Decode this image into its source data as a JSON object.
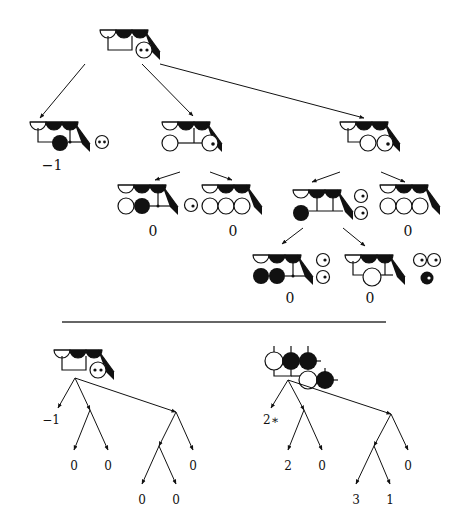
{
  "figure": {
    "type": "game-tree-diagram",
    "colors": {
      "ink": "#111111",
      "background": "#ffffff",
      "rule": "#333333"
    },
    "top_tree": {
      "root": {
        "id": "root",
        "x": 128,
        "y": 44,
        "label": ""
      },
      "nodes": [
        {
          "id": "L",
          "x": 55,
          "y": 138,
          "value": "−1",
          "value_x": 52,
          "value_y": 158
        },
        {
          "id": "M",
          "x": 195,
          "y": 138,
          "value": ""
        },
        {
          "id": "R",
          "x": 370,
          "y": 138,
          "value": ""
        },
        {
          "id": "ML",
          "x": 150,
          "y": 200,
          "value": "0",
          "value_x": 153,
          "value_y": 224
        },
        {
          "id": "MR",
          "x": 230,
          "y": 200,
          "value": "0",
          "value_x": 233,
          "value_y": 224
        },
        {
          "id": "RL",
          "x": 315,
          "y": 200,
          "value": "",
          "value_x": 0,
          "value_y": 0
        },
        {
          "id": "RR",
          "x": 405,
          "y": 200,
          "value": "0",
          "value_x": 408,
          "value_y": 224
        },
        {
          "id": "RLL",
          "x": 285,
          "y": 265,
          "value": "0",
          "value_x": 290,
          "value_y": 291
        },
        {
          "id": "RLR",
          "x": 370,
          "y": 265,
          "value": "0",
          "value_x": 370,
          "value_y": 291
        }
      ],
      "edges": [
        {
          "from": [
            85,
            64
          ],
          "to": [
            40,
            118
          ]
        },
        {
          "from": [
            142,
            64
          ],
          "to": [
            193,
            116
          ]
        },
        {
          "from": [
            160,
            64
          ],
          "to": [
            364,
            118
          ]
        },
        {
          "from": [
            180,
            172
          ],
          "to": [
            155,
            180
          ]
        },
        {
          "from": [
            210,
            172
          ],
          "to": [
            232,
            180
          ]
        },
        {
          "from": [
            340,
            172
          ],
          "to": [
            312,
            182
          ]
        },
        {
          "from": [
            381,
            172
          ],
          "to": [
            405,
            182
          ]
        },
        {
          "from": [
            303,
            228
          ],
          "to": [
            282,
            244
          ]
        },
        {
          "from": [
            343,
            228
          ],
          "to": [
            365,
            246
          ]
        }
      ]
    },
    "divider": {
      "x1": 62,
      "x2": 386,
      "y": 322
    },
    "bottom_left_tree": {
      "root_x": 75,
      "root_y": 378,
      "values": [
        {
          "text": "−1",
          "x": 51,
          "y": 414
        },
        {
          "text": "0",
          "x": 74,
          "y": 460
        },
        {
          "text": "0",
          "x": 108,
          "y": 460
        },
        {
          "text": "0",
          "x": 193,
          "y": 460
        },
        {
          "text": "0",
          "x": 142,
          "y": 494
        },
        {
          "text": "0",
          "x": 176,
          "y": 494
        }
      ],
      "edges": [
        [
          75,
          378,
          58,
          408
        ],
        [
          75,
          378,
          90,
          410
        ],
        [
          75,
          378,
          176,
          412
        ],
        [
          90,
          410,
          74,
          450
        ],
        [
          90,
          410,
          108,
          450
        ],
        [
          176,
          412,
          159,
          446
        ],
        [
          176,
          412,
          193,
          450
        ],
        [
          159,
          446,
          142,
          484
        ],
        [
          159,
          446,
          176,
          484
        ]
      ]
    },
    "bottom_right_tree": {
      "root_x": 288,
      "root_y": 380,
      "values": [
        {
          "text": "2∗",
          "x": 271,
          "y": 414
        },
        {
          "text": "2",
          "x": 288,
          "y": 460
        },
        {
          "text": "0",
          "x": 322,
          "y": 460
        },
        {
          "text": "0",
          "x": 408,
          "y": 460
        },
        {
          "text": "3",
          "x": 356,
          "y": 494
        },
        {
          "text": "1",
          "x": 390,
          "y": 494
        }
      ],
      "edges": [
        [
          288,
          380,
          271,
          408
        ],
        [
          288,
          380,
          304,
          410
        ],
        [
          288,
          380,
          391,
          414
        ],
        [
          304,
          410,
          288,
          450
        ],
        [
          304,
          410,
          322,
          450
        ],
        [
          391,
          414,
          374,
          446
        ],
        [
          391,
          414,
          408,
          450
        ],
        [
          374,
          446,
          356,
          484
        ],
        [
          374,
          446,
          390,
          484
        ]
      ]
    }
  }
}
